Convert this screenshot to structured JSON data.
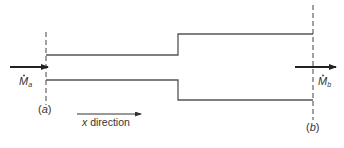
{
  "diagram": {
    "type": "control-volume pipe expansion",
    "colors": {
      "pipe_wall": "#555555",
      "dashed_boundary": "#444444",
      "flow_arrow": "#222222",
      "text": "#333333"
    },
    "inlet": {
      "flow_label_main": "M",
      "flow_label_sub": "a",
      "flow_label_accent": "dot",
      "section_label_open": "(",
      "section_label_letter": "a",
      "section_label_close": ")"
    },
    "outlet": {
      "flow_label_main": "M",
      "flow_label_sub": "b",
      "flow_label_accent": "dot",
      "section_label_open": "(",
      "section_label_letter": "b",
      "section_label_close": ")"
    },
    "direction": {
      "var": "x",
      "label": " direction"
    }
  }
}
